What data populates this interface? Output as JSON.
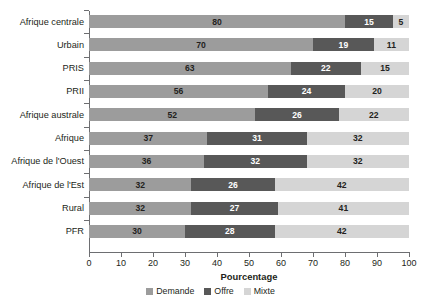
{
  "chart_data": {
    "type": "bar",
    "orientation": "horizontal",
    "stacked": true,
    "title": "",
    "xlabel": "Pourcentage",
    "ylabel": "",
    "xlim": [
      0,
      100
    ],
    "xticks": [
      0,
      10,
      20,
      30,
      40,
      50,
      60,
      70,
      80,
      90,
      100
    ],
    "grid": false,
    "legend_position": "bottom-center",
    "categories": [
      "Afrique centrale",
      "Urbain",
      "PRIS",
      "PRII",
      "Afrique australe",
      "Afrique",
      "Afrique de l'Ouest",
      "Afrique de l'Est",
      "Rural",
      "PFR"
    ],
    "series": [
      {
        "name": "Demande",
        "color": "#9c9c9c",
        "values": [
          80,
          70,
          63,
          56,
          52,
          37,
          36,
          32,
          32,
          30
        ]
      },
      {
        "name": "Offre",
        "color": "#585858",
        "values": [
          15,
          19,
          22,
          24,
          26,
          31,
          32,
          26,
          27,
          28
        ]
      },
      {
        "name": "Mixte",
        "color": "#d5d5d5",
        "values": [
          5,
          11,
          15,
          20,
          22,
          32,
          32,
          42,
          41,
          42
        ]
      }
    ]
  }
}
